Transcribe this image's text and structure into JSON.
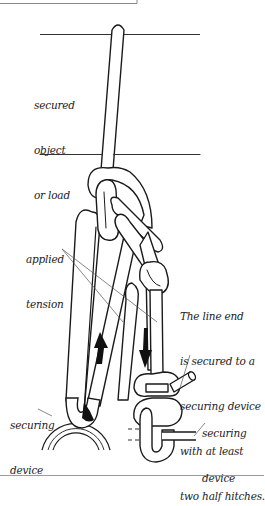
{
  "figure": {
    "type": "knot-diagram",
    "colors": {
      "line": "#1a1a1a",
      "leader": "#555555",
      "frame": "#8a8a8a",
      "background": "#ffffff"
    }
  },
  "labels": {
    "secured_object": [
      "secured",
      "object",
      "or load"
    ],
    "applied_tension": [
      "applied",
      "tension"
    ],
    "caption": [
      "The line end",
      "is secured to a",
      "securing device",
      "with at least",
      "two half hitches."
    ],
    "securing_device_left": [
      "securing",
      "device"
    ],
    "securing_device_right": [
      "securing",
      "device"
    ]
  },
  "arrows": [
    {
      "name": "up-arrow",
      "direction": "up"
    },
    {
      "name": "down-arrow",
      "direction": "down"
    }
  ]
}
